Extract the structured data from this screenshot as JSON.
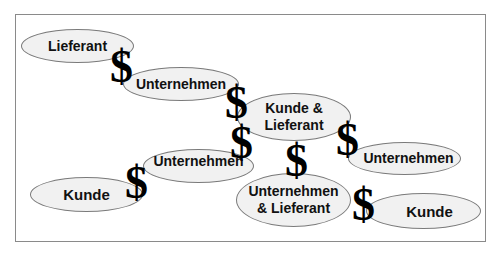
{
  "diagram": {
    "type": "value-chain-flow",
    "nodes": [
      {
        "id": "n1",
        "label": "Lieferant"
      },
      {
        "id": "n2",
        "label": "Unternehmen"
      },
      {
        "id": "n3",
        "label": "Kunde & Lieferant"
      },
      {
        "id": "n4",
        "label": "Unternehmen"
      },
      {
        "id": "n5",
        "label": "Unternehmen"
      },
      {
        "id": "n6",
        "label": "Kunde"
      },
      {
        "id": "n7",
        "label": "Unternehmen & Lieferant"
      },
      {
        "id": "n8",
        "label": "Kunde"
      }
    ],
    "n3_lines": [
      "Kunde &",
      "Lieferant"
    ],
    "n7_lines": [
      "Unternehmen",
      "& Lieferant"
    ],
    "money_symbol": "$",
    "money_symbol_count": 7,
    "colors": {
      "ellipse_fill": "#f1f1f1",
      "ellipse_border": "#7a7a7a",
      "frame_border": "#8a8a8a",
      "symbol": "#000000"
    }
  }
}
